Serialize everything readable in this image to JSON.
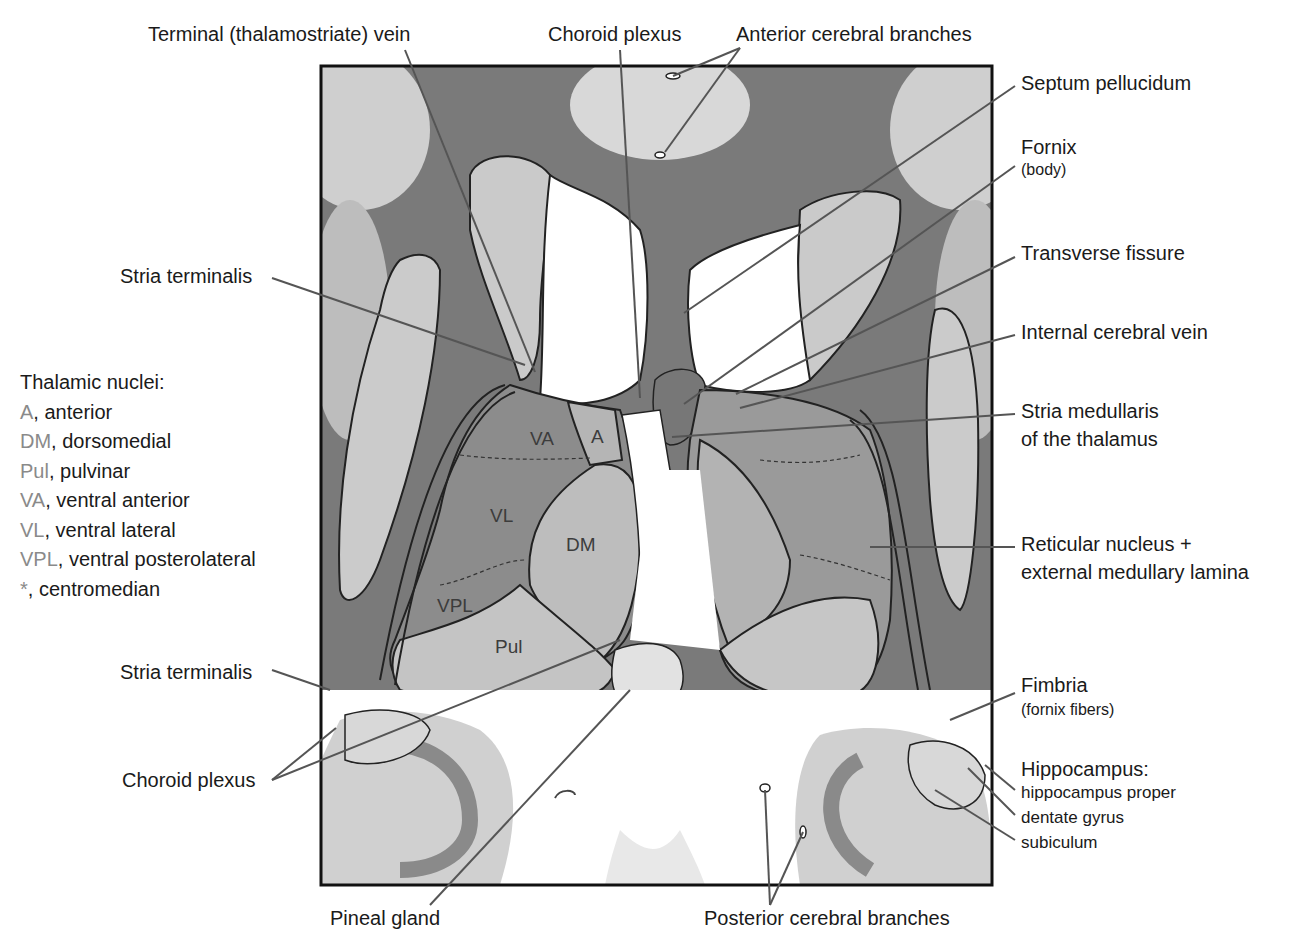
{
  "labels_top": {
    "terminal_vein": "Terminal (thalamostriate) vein",
    "choroid_plexus": "Choroid plexus",
    "anterior_cerebral_branches": "Anterior cerebral branches"
  },
  "labels_right": {
    "septum_pellucidum": "Septum pellucidum",
    "fornix": "Fornix",
    "fornix_sub": "(body)",
    "transverse_fissure": "Transverse fissure",
    "internal_cerebral_vein": "Internal cerebral vein",
    "stria_medullaris_1": "Stria medullaris",
    "stria_medullaris_2": "of the thalamus",
    "reticular_1": "Reticular nucleus +",
    "reticular_2": "external medullary lamina",
    "fimbria": "Fimbria",
    "fimbria_sub": "(fornix fibers)",
    "hippocampus": "Hippocampus:",
    "hippocampus_items": [
      "hippocampus proper",
      "dentate gyrus",
      "subiculum"
    ]
  },
  "labels_left": {
    "stria_terminalis_upper": "Stria terminalis",
    "stria_terminalis_lower": "Stria terminalis",
    "choroid_plexus_lower": "Choroid plexus"
  },
  "labels_bottom": {
    "pineal_gland": "Pineal gland",
    "posterior_cerebral_branches": "Posterior cerebral branches"
  },
  "legend": {
    "title": "Thalamic nuclei:",
    "items": [
      {
        "abbr": "A",
        "name": ", anterior"
      },
      {
        "abbr": "DM",
        "name": ", dorsomedial"
      },
      {
        "abbr": "Pul",
        "name": ", pulvinar"
      },
      {
        "abbr": "VA",
        "name": ", ventral anterior"
      },
      {
        "abbr": "VL",
        "name": ", ventral lateral"
      },
      {
        "abbr": "VPL",
        "name": ", ventral posterolateral"
      },
      {
        "abbr": "*",
        "name": ", centromedian"
      }
    ]
  },
  "nuclei_in_image": {
    "va": "VA",
    "a": "A",
    "vl": "VL",
    "dm": "DM",
    "vpl": "VPL",
    "pul": "Pul"
  },
  "colors": {
    "white_matter": "#6e6e6e",
    "gray_matter": "#c9c9c9",
    "ventricle": "#ffffff",
    "label_text": "#1a1a1a",
    "legend_abbr": "#8a8a8a",
    "leader_line": "#555555"
  }
}
